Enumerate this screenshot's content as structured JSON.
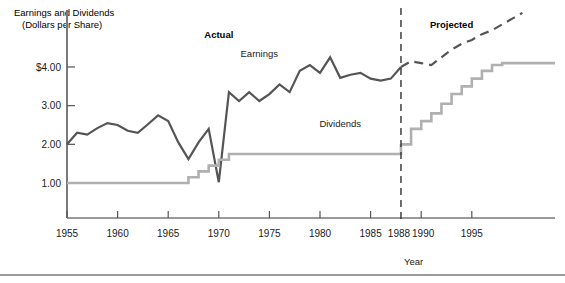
{
  "chart_data": {
    "type": "line",
    "title": "Earnings and Dividends",
    "subtitle": "(Dollars per Share)",
    "xlabel": "Year",
    "ylabel": "",
    "xlim": [
      1955,
      2000
    ],
    "ylim": [
      0,
      4.9
    ],
    "grid": false,
    "legend_position": "inline-annotations",
    "y_ticks": [
      "$4.00",
      "3.00",
      "2.00",
      "1.00"
    ],
    "y_tick_values": [
      4.0,
      3.0,
      2.0,
      1.0
    ],
    "x_ticks": [
      "1955",
      "1960",
      "1965",
      "1970",
      "1975",
      "1980",
      "1985",
      "1988",
      "1990",
      "1995"
    ],
    "x_tick_values": [
      1955,
      1960,
      1965,
      1970,
      1975,
      1980,
      1985,
      1988,
      1990,
      1995
    ],
    "annotations": [
      {
        "text": "Actual",
        "x": 1970,
        "y": 4.75,
        "bold": true
      },
      {
        "text": "Projected",
        "x": 1993,
        "y": 5.0,
        "bold": true
      },
      {
        "text": "Earnings",
        "x": 1974,
        "y": 4.25,
        "bold": false
      },
      {
        "text": "Dividends",
        "x": 1982,
        "y": 2.45,
        "bold": false
      }
    ],
    "divider": {
      "x": 1988,
      "label": "1988",
      "style": "dashed"
    },
    "series": [
      {
        "name": "Earnings",
        "color": "#555555",
        "style": "solid",
        "phase": "actual",
        "x": [
          1955,
          1956,
          1957,
          1958,
          1959,
          1960,
          1961,
          1962,
          1963,
          1964,
          1965,
          1966,
          1967,
          1968,
          1969,
          1970,
          1971,
          1972,
          1973,
          1974,
          1975,
          1976,
          1977,
          1978,
          1979,
          1980,
          1981,
          1982,
          1983,
          1984,
          1985,
          1986,
          1987,
          1988
        ],
        "values": [
          2.0,
          2.3,
          2.25,
          2.42,
          2.55,
          2.5,
          2.35,
          2.3,
          2.52,
          2.75,
          2.6,
          2.05,
          1.62,
          2.05,
          2.4,
          1.02,
          3.35,
          3.12,
          3.35,
          3.12,
          3.3,
          3.55,
          3.35,
          3.9,
          4.05,
          3.85,
          4.25,
          3.72,
          3.8,
          3.85,
          3.7,
          3.65,
          3.7,
          4.0
        ]
      },
      {
        "name": "Earnings",
        "color": "#555555",
        "style": "dashed",
        "phase": "projected",
        "x": [
          1988,
          1989,
          1990,
          1991,
          1992,
          1993,
          1994,
          1995,
          1996,
          1997,
          1998,
          1999,
          2000
        ],
        "values": [
          4.0,
          4.15,
          4.1,
          4.05,
          4.25,
          4.45,
          4.6,
          4.7,
          4.85,
          4.95,
          5.1,
          5.25,
          5.4
        ]
      },
      {
        "name": "Dividends",
        "color": "#b0b0b0",
        "style": "step",
        "phase": "actual",
        "x": [
          1955,
          1966,
          1967,
          1968,
          1969,
          1970,
          1971,
          1978,
          1988
        ],
        "values": [
          1.0,
          1.0,
          1.15,
          1.3,
          1.45,
          1.6,
          1.75,
          1.75,
          2.0
        ]
      },
      {
        "name": "Dividends",
        "color": "#b0b0b0",
        "style": "step",
        "phase": "projected",
        "x": [
          1988,
          1989,
          1990,
          1991,
          1992,
          1993,
          1994,
          1995,
          1996,
          1997,
          1998,
          1999,
          2000
        ],
        "values": [
          2.0,
          2.4,
          2.6,
          2.8,
          3.05,
          3.3,
          3.5,
          3.7,
          3.9,
          4.05,
          4.1,
          4.1,
          4.1
        ]
      }
    ]
  },
  "axes": {
    "y_axis_name": "",
    "x_axis_name": "Year",
    "title_line1": "Earnings and Dividends",
    "title_line2": "(Dollars per Share)"
  }
}
